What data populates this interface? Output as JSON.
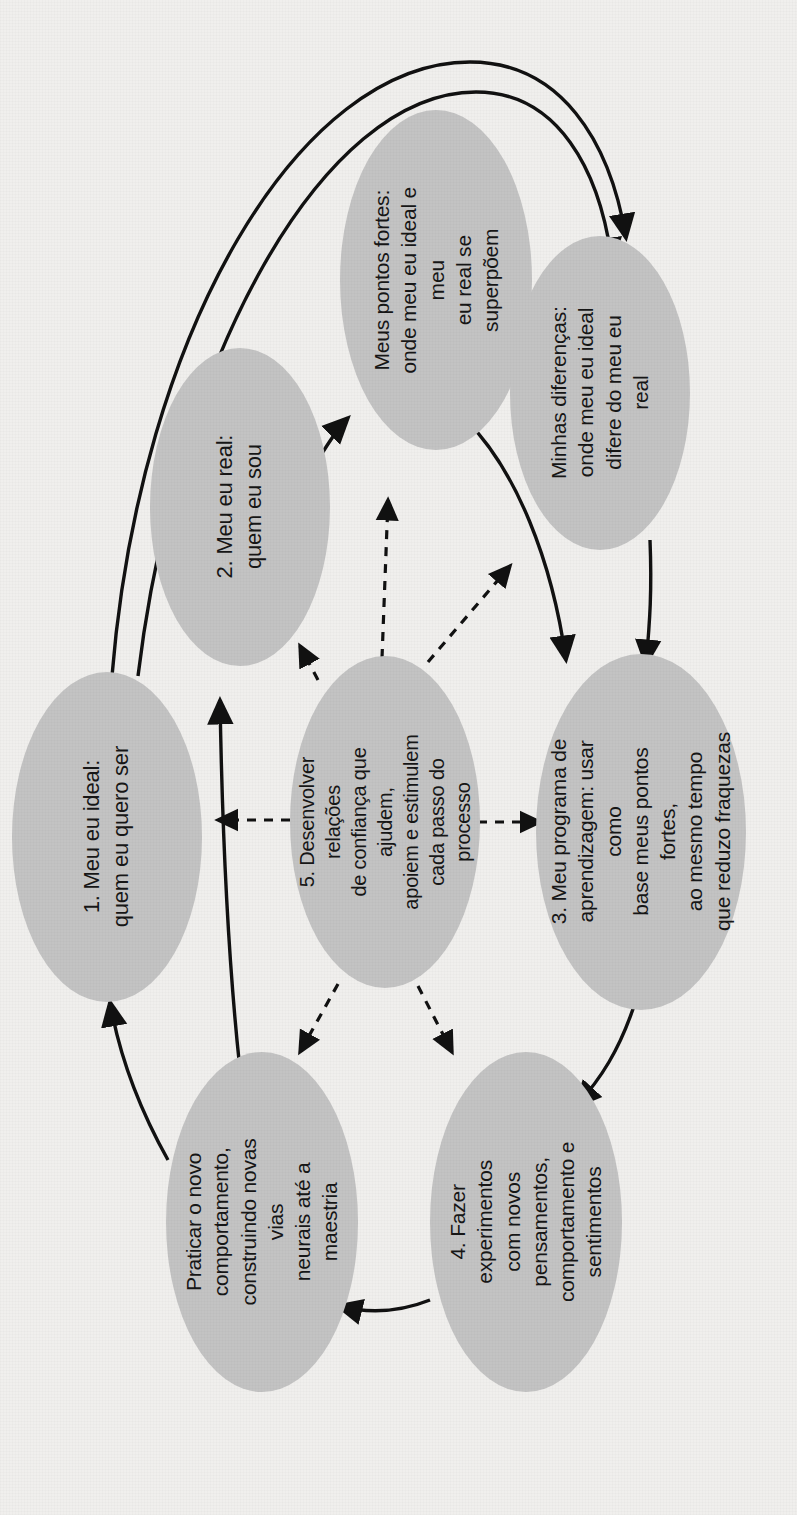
{
  "diagram": {
    "orientation": "rotated-90-ccw",
    "colors": {
      "background": "#f0efed",
      "node_fill": "#c3c3c3",
      "edge_stroke": "#111111",
      "text": "#161616"
    },
    "nodes": [
      {
        "id": "n1",
        "name": "meu-eu-ideal",
        "label": "1. Meu eu ideal:\nquem eu quero ser"
      },
      {
        "id": "n2",
        "name": "meu-eu-real",
        "label": "2. Meu eu real:\nquem eu sou"
      },
      {
        "id": "n3",
        "name": "meus-pontos-fortes",
        "label": "Meus pontos fortes:\nonde meu eu ideal e meu\neu real se superpõem"
      },
      {
        "id": "n4",
        "name": "minhas-diferencas",
        "label": "Minhas diferenças:\nonde meu eu ideal\ndifere do meu eu real"
      },
      {
        "id": "n5",
        "name": "meu-programa-de-aprendizagem",
        "label": "3. Meu programa de\naprendizagem: usar como\nbase meus pontos fortes,\nao mesmo tempo\nque reduzo fraquezas"
      },
      {
        "id": "n6",
        "name": "desenvolver-relacoes-de-confianca",
        "label": "5. Desenvolver relações\nde confiança que ajudem,\napoiem e estimulem\ncada passo do processo"
      },
      {
        "id": "n7",
        "name": "praticar-o-novo-comportamento",
        "label": "Praticar o novo\ncomportamento,\nconstruindo novas vias\nneurais até a maestria"
      },
      {
        "id": "n8",
        "name": "fazer-experimentos",
        "label": "4. Fazer experimentos\ncom novos pensamentos,\ncomportamento e\nsentimentos"
      }
    ],
    "edges": [
      {
        "from": "n1",
        "to": "n4",
        "style": "solid"
      },
      {
        "from": "n2",
        "to": "n4",
        "style": "solid"
      },
      {
        "from": "n2",
        "to": "n3",
        "style": "solid"
      },
      {
        "from": "n3",
        "to": "n5",
        "style": "solid"
      },
      {
        "from": "n4",
        "to": "n5",
        "style": "solid"
      },
      {
        "from": "n5",
        "to": "n8",
        "style": "solid"
      },
      {
        "from": "n8",
        "to": "n7",
        "style": "solid"
      },
      {
        "from": "n7",
        "to": "n1",
        "style": "solid"
      },
      {
        "from": "n7",
        "to": "n2",
        "style": "solid"
      },
      {
        "from": "n6",
        "to": "n1",
        "style": "dashed"
      },
      {
        "from": "n6",
        "to": "n2",
        "style": "dashed"
      },
      {
        "from": "n6",
        "to": "n3",
        "style": "dashed"
      },
      {
        "from": "n6",
        "to": "n4",
        "style": "dashed"
      },
      {
        "from": "n6",
        "to": "n5",
        "style": "dashed"
      },
      {
        "from": "n6",
        "to": "n7",
        "style": "dashed"
      },
      {
        "from": "n6",
        "to": "n8",
        "style": "dashed"
      }
    ]
  }
}
